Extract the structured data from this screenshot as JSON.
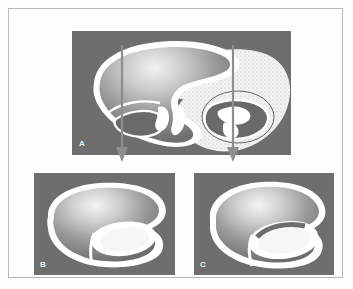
{
  "figure": {
    "type": "anatomical-illustration",
    "background_color": "#fdfdfc",
    "frame_color": "#b9b9b5",
    "panel_background_color": "#6e6e6e",
    "tissue_outline_color": "#ffffff",
    "arrow_color": "#8a8a8a"
  },
  "panels": [
    {
      "id": "a",
      "label": "A",
      "caption": "",
      "view": "long-axis",
      "x": 63,
      "y": 22,
      "width": 219,
      "height": 124
    },
    {
      "id": "b",
      "label": "B",
      "caption": "",
      "view": "short-axis-upper",
      "x": 25,
      "y": 164,
      "width": 141,
      "height": 102
    },
    {
      "id": "c",
      "label": "C",
      "caption": "",
      "view": "short-axis-lower",
      "x": 185,
      "y": 164,
      "width": 140,
      "height": 102
    }
  ],
  "arrows": [
    {
      "id": "arrow-left",
      "from_panel": "a",
      "to_panel": "b",
      "x": 122,
      "y_start": 45,
      "y_end": 160,
      "color": "#8a8a8a"
    },
    {
      "id": "arrow-right",
      "from_panel": "a",
      "to_panel": "c",
      "x": 233,
      "y_start": 45,
      "y_end": 160,
      "color": "#8a8a8a"
    }
  ]
}
